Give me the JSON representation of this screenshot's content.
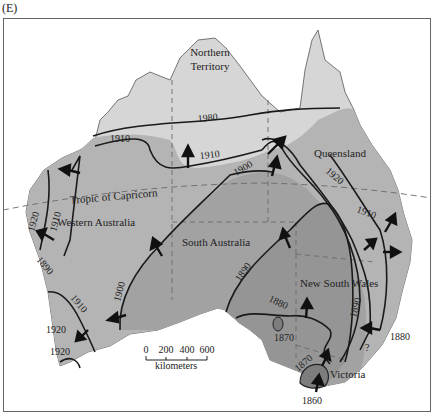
{
  "panel_label": "(E)",
  "colors": {
    "background": "#ffffff",
    "land_light": "#d6d6d6",
    "land_medium": "#b4b4b4",
    "land_dark": "#9a9a9a",
    "land_darkest": "#7d7d7d",
    "line": "#1a1a1a",
    "border_dashed": "#6a6a6a"
  },
  "regions": [
    {
      "id": "northern-territory",
      "label_line1": "Northern",
      "label_line2": "Territory"
    },
    {
      "id": "queensland",
      "label": "Queensland"
    },
    {
      "id": "western-australia",
      "label": "Western Australia"
    },
    {
      "id": "south-australia",
      "label": "South Australia"
    },
    {
      "id": "new-south-wales",
      "label": "New South Wales"
    },
    {
      "id": "victoria",
      "label": "Victoria"
    }
  ],
  "tropic_label": "Tropic of Capricorn",
  "isolines": {
    "y1980": "1980",
    "y1910_nw": "1910",
    "y1910_n": "1910",
    "y1900": "1900",
    "y1920_q": "1920",
    "y1910_e": "1910",
    "y1920_w": "1920",
    "y1910_w": "1910",
    "y1890_w": "1890",
    "y1900_sw": "1900",
    "y1910_sw": "1910",
    "y1920_sw1": "1920",
    "y1920_sw2": "1920",
    "y1890_sa": "1890",
    "y1880_sa": "1880",
    "y1890_nsw": "1890",
    "y1870_a": "1870",
    "y1870_b": "1870",
    "y1860": "1860",
    "y1880_e": "1880",
    "question": "?"
  },
  "scale": {
    "ticks": [
      "0",
      "200",
      "400",
      "600"
    ],
    "unit": "kilometers"
  }
}
